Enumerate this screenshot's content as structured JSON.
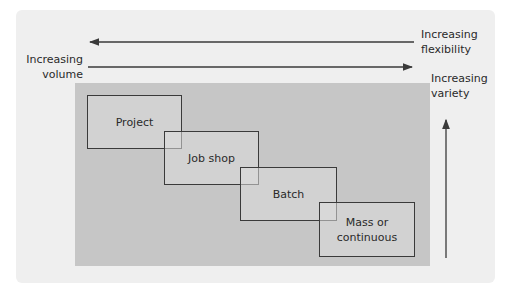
{
  "diagram": {
    "type": "process-types-matrix",
    "axes": {
      "flexibility": {
        "label_line1": "Increasing",
        "label_line2": "flexibility",
        "direction": "left"
      },
      "volume": {
        "label_line1": "Increasing",
        "label_line2": "volume",
        "direction": "right"
      },
      "variety": {
        "label_line1": "Increasing",
        "label_line2": "variety",
        "direction": "up"
      }
    },
    "boxes": [
      {
        "label": "Project"
      },
      {
        "label": "Job shop"
      },
      {
        "label": "Batch"
      },
      {
        "label_line1": "Mass or",
        "label_line2": "continuous"
      }
    ]
  },
  "colors": {
    "panel": "#efefef",
    "region": "#c6c6c6",
    "lines": "#3a3a3a"
  }
}
